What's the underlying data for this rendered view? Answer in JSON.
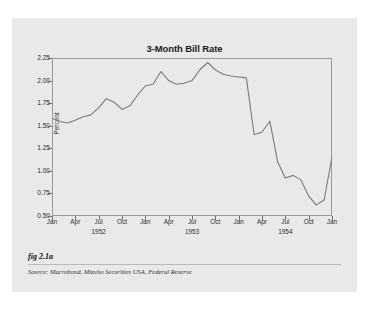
{
  "figure": {
    "fig_label": "fig 2.1a",
    "source": "Source:  Macrobond, Mizuho Securities USA, Federal Reserve",
    "background_color": "#e9e9e9",
    "page_color": "#ffffff"
  },
  "chart_data": {
    "type": "line",
    "title": "3-Month Bill Rate",
    "xlabel": "",
    "ylabel": "Percent",
    "ylim": [
      0.5,
      2.25
    ],
    "yticks": [
      "0.50",
      "0.75",
      "1.00",
      "1.25",
      "1.50",
      "1.75",
      "2.00",
      "2.25"
    ],
    "ytick_values": [
      0.5,
      0.75,
      1.0,
      1.25,
      1.5,
      1.75,
      2.0,
      2.25
    ],
    "xticks": [
      "Jan",
      "Apr",
      "Jul",
      "Oct",
      "Jan",
      "Apr",
      "Jul",
      "Oct",
      "Jan",
      "Apr",
      "Jul",
      "Oct",
      "Jan"
    ],
    "xyears": [
      {
        "index": 2,
        "label": "1952"
      },
      {
        "index": 6,
        "label": "1953"
      },
      {
        "index": 10,
        "label": "1954"
      }
    ],
    "grid": false,
    "legend": "none",
    "line_color": "#7a7a7a",
    "series": [
      {
        "name": "3-Month Bill Rate",
        "x": [
          "1952-01",
          "1952-02",
          "1952-03",
          "1952-04",
          "1952-05",
          "1952-06",
          "1952-07",
          "1952-08",
          "1952-09",
          "1952-10",
          "1952-11",
          "1952-12",
          "1953-01",
          "1953-02",
          "1953-03",
          "1953-04",
          "1953-05",
          "1953-06",
          "1953-07",
          "1953-08",
          "1953-09",
          "1953-10",
          "1953-11",
          "1953-12",
          "1954-01",
          "1954-02",
          "1954-03",
          "1954-04",
          "1954-05",
          "1954-06",
          "1954-07",
          "1954-08",
          "1954-09",
          "1954-10",
          "1954-11",
          "1954-12",
          "1955-01"
        ],
        "values": [
          1.58,
          1.55,
          1.53,
          1.57,
          1.6,
          1.62,
          1.7,
          1.8,
          1.76,
          1.68,
          1.72,
          1.84,
          1.94,
          1.96,
          2.1,
          2.02,
          1.96,
          1.97,
          2.0,
          2.12,
          2.2,
          2.12,
          2.07,
          2.05,
          2.04,
          2.03,
          1.98,
          1.45,
          1.4,
          1.5,
          1.57,
          1.3,
          1.07,
          0.92,
          0.95,
          0.88,
          1.15
        ]
      }
    ],
    "annotations": {
      "peak": {
        "value": 2.2,
        "approx_date": "1953-09"
      },
      "trough": {
        "value": 0.62,
        "approx_date": "1954-07"
      },
      "end_value": 1.15
    },
    "plot_points": [
      [
        0.0,
        1.58
      ],
      [
        0.028,
        1.55
      ],
      [
        0.055,
        1.53
      ],
      [
        0.083,
        1.56
      ],
      [
        0.111,
        1.6
      ],
      [
        0.139,
        1.62
      ],
      [
        0.167,
        1.7
      ],
      [
        0.194,
        1.8
      ],
      [
        0.222,
        1.76
      ],
      [
        0.25,
        1.68
      ],
      [
        0.278,
        1.72
      ],
      [
        0.306,
        1.84
      ],
      [
        0.333,
        1.94
      ],
      [
        0.361,
        1.96
      ],
      [
        0.389,
        2.1
      ],
      [
        0.417,
        2.0
      ],
      [
        0.444,
        1.96
      ],
      [
        0.472,
        1.97
      ],
      [
        0.5,
        2.0
      ],
      [
        0.528,
        2.12
      ],
      [
        0.556,
        2.2
      ],
      [
        0.583,
        2.12
      ],
      [
        0.611,
        2.07
      ],
      [
        0.639,
        2.05
      ],
      [
        0.667,
        2.04
      ],
      [
        0.694,
        2.03
      ],
      [
        0.722,
        1.4
      ],
      [
        0.75,
        1.43
      ],
      [
        0.778,
        1.55
      ],
      [
        0.806,
        1.1
      ],
      [
        0.833,
        0.92
      ],
      [
        0.861,
        0.95
      ],
      [
        0.889,
        0.9
      ],
      [
        0.917,
        0.72
      ],
      [
        0.944,
        0.62
      ],
      [
        0.972,
        0.68
      ],
      [
        1.0,
        1.15
      ]
    ]
  }
}
